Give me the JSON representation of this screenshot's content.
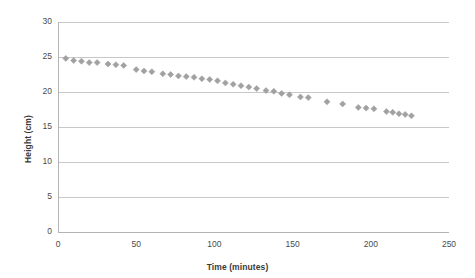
{
  "chart_data": {
    "type": "scatter",
    "title": "",
    "xlabel": "Time (minutes)",
    "ylabel": "Height (cm)",
    "xlim": [
      0,
      250
    ],
    "ylim": [
      0,
      30
    ],
    "xticks": [
      0,
      50,
      100,
      150,
      200,
      250
    ],
    "yticks": [
      0,
      5,
      10,
      15,
      20,
      25,
      30
    ],
    "grid": "horizontal",
    "legend": "none",
    "marker": "diamond",
    "marker_color": "#9a9a9a",
    "series": [
      {
        "name": "Height",
        "points": [
          [
            5,
            24.8
          ],
          [
            10,
            24.5
          ],
          [
            15,
            24.4
          ],
          [
            20,
            24.2
          ],
          [
            25,
            24.2
          ],
          [
            32,
            24.0
          ],
          [
            37,
            23.9
          ],
          [
            42,
            23.8
          ],
          [
            50,
            23.2
          ],
          [
            55,
            23.0
          ],
          [
            60,
            22.9
          ],
          [
            67,
            22.6
          ],
          [
            72,
            22.5
          ],
          [
            77,
            22.3
          ],
          [
            82,
            22.2
          ],
          [
            87,
            22.1
          ],
          [
            92,
            21.9
          ],
          [
            97,
            21.8
          ],
          [
            102,
            21.6
          ],
          [
            107,
            21.3
          ],
          [
            112,
            21.1
          ],
          [
            117,
            20.9
          ],
          [
            122,
            20.7
          ],
          [
            127,
            20.5
          ],
          [
            133,
            20.2
          ],
          [
            138,
            20.1
          ],
          [
            143,
            19.8
          ],
          [
            148,
            19.6
          ],
          [
            155,
            19.3
          ],
          [
            160,
            19.2
          ],
          [
            172,
            18.6
          ],
          [
            182,
            18.3
          ],
          [
            192,
            17.8
          ],
          [
            197,
            17.7
          ],
          [
            202,
            17.6
          ],
          [
            210,
            17.2
          ],
          [
            214,
            17.1
          ],
          [
            218,
            16.9
          ],
          [
            222,
            16.8
          ],
          [
            226,
            16.6
          ]
        ]
      }
    ]
  },
  "axes": {
    "y_title": "Height (cm)",
    "x_title": "Time (minutes)",
    "y_tick_labels": [
      "30",
      "25",
      "20",
      "15",
      "10",
      "5",
      "0"
    ],
    "x_tick_labels": [
      "0",
      "50",
      "100",
      "150",
      "200",
      "250"
    ]
  },
  "colors": {
    "marker": "#9a9a9a",
    "gridline": "#c8c8c8",
    "axis": "#b4b4b4",
    "text": "#3a3a3a",
    "background": "#ffffff"
  }
}
